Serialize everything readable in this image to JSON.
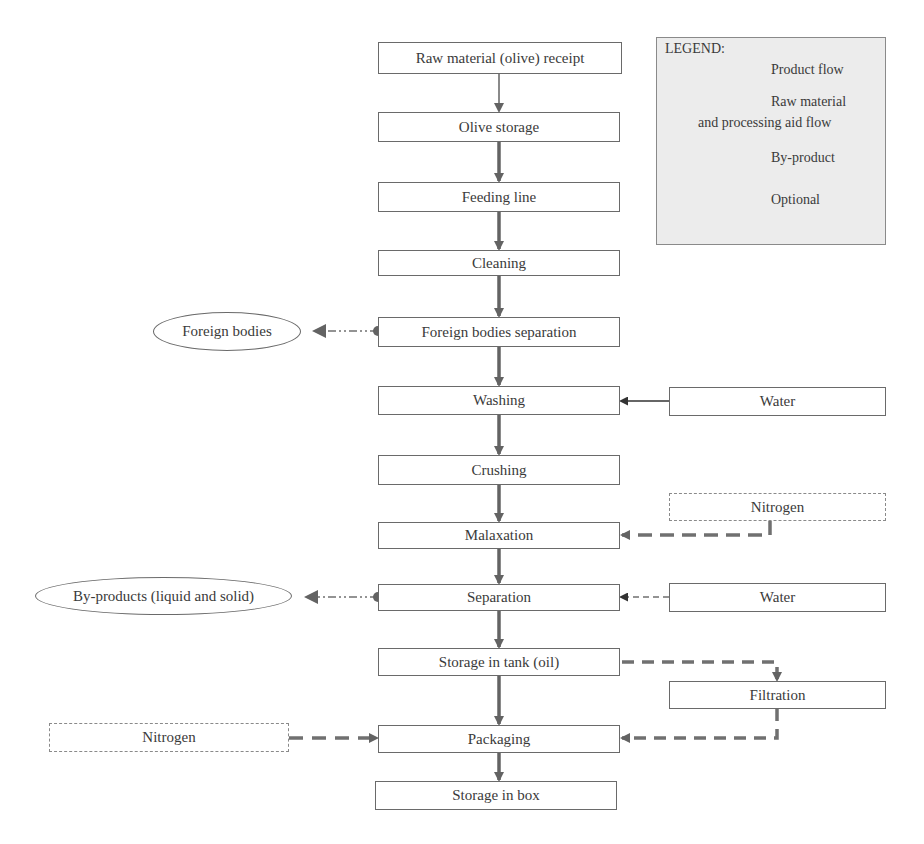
{
  "legend": {
    "title": "LEGEND:",
    "items": [
      {
        "type": "product_flow",
        "label": "Product flow"
      },
      {
        "type": "raw_material_flow",
        "label_line1": "Raw material",
        "label_line2": "and processing  aid flow"
      },
      {
        "type": "by_product",
        "label": "By-product"
      },
      {
        "type": "optional",
        "label": "Optional"
      }
    ]
  },
  "main_steps": [
    {
      "id": "receipt",
      "label": "Raw material (olive) receipt"
    },
    {
      "id": "olive_storage",
      "label": "Olive storage"
    },
    {
      "id": "feeding_line",
      "label": "Feeding line"
    },
    {
      "id": "cleaning",
      "label": "Cleaning"
    },
    {
      "id": "foreign_bodies_separation",
      "label": "Foreign bodies separation"
    },
    {
      "id": "washing",
      "label": "Washing"
    },
    {
      "id": "crushing",
      "label": "Crushing"
    },
    {
      "id": "malaxation",
      "label": "Malaxation"
    },
    {
      "id": "separation",
      "label": "Separation"
    },
    {
      "id": "storage_tank",
      "label": "Storage in tank (oil)"
    },
    {
      "id": "packaging",
      "label": "Packaging"
    },
    {
      "id": "storage_box",
      "label": "Storage in box"
    }
  ],
  "side_inputs": {
    "washing_water": "Water",
    "malaxation_nitrogen": "Nitrogen",
    "separation_water": "Water",
    "filtration": "Filtration",
    "packaging_nitrogen": "Nitrogen"
  },
  "by_products": {
    "foreign_bodies": "Foreign bodies",
    "separation_by_products": "By-products (liquid and solid)"
  },
  "colors": {
    "line": "#636363",
    "box_border": "#6a6a6a",
    "legend_bg": "#ececec",
    "text": "#3a3a3a"
  }
}
